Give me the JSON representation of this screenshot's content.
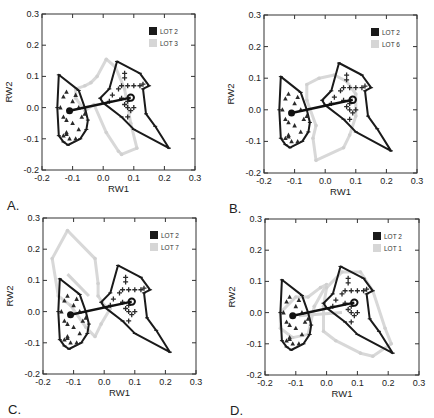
{
  "chart_data": [
    {
      "type": "scatter",
      "panel": "A.",
      "xlabel": "RW1",
      "ylabel": "RW2",
      "xlim": [
        -0.2,
        0.3
      ],
      "ylim": [
        -0.2,
        0.3
      ],
      "xticks": [
        "-0.2",
        "-0.1",
        "0.0",
        "0.1",
        "0.2",
        "0.3"
      ],
      "yticks": [
        "0.3",
        "0.2",
        "0.1",
        "0.0",
        "-0.1",
        "-0.2"
      ],
      "legend": [
        {
          "label": "LOT 2",
          "color": "#1a1a1a"
        },
        {
          "label": "LOT 3",
          "color": "#d6d6d6"
        }
      ],
      "comparison": "LOT 3",
      "gray_hulls": [
        [
          [
            -0.09,
            0.06
          ],
          [
            -0.06,
            0.07
          ],
          [
            -0.04,
            0.08
          ],
          [
            -0.02,
            0.1
          ],
          [
            0.01,
            0.155
          ],
          [
            0.04,
            0.13
          ],
          [
            0.07,
            0.06
          ],
          [
            0.09,
            -0.05
          ],
          [
            0.11,
            -0.13
          ],
          [
            0.06,
            -0.15
          ],
          [
            0.05,
            -0.14
          ],
          [
            0.01,
            -0.08
          ],
          [
            -0.03,
            0.01
          ],
          [
            -0.06,
            -0.01
          ],
          [
            -0.09,
            0.03
          ]
        ]
      ],
      "gray_link": [
        [
          -0.06,
          0.0
        ],
        [
          0.03,
          0.02
        ]
      ]
    },
    {
      "type": "scatter",
      "panel": "B.",
      "xlabel": "RW1",
      "ylabel": "RW2",
      "xlim": [
        -0.2,
        0.3
      ],
      "ylim": [
        -0.2,
        0.3
      ],
      "xticks": [
        "-0.2",
        "-0.1",
        "0.0",
        "0.1",
        "0.2",
        "0.3"
      ],
      "yticks": [
        "0.3",
        "0.2",
        "0.1",
        "0.0",
        "-0.1",
        "-0.2"
      ],
      "legend": [
        {
          "label": "LOT 2",
          "color": "#1a1a1a"
        },
        {
          "label": "LOT 6",
          "color": "#d6d6d6"
        }
      ],
      "comparison": "LOT 6",
      "gray_hulls": [
        [
          [
            -0.06,
            0.08
          ],
          [
            -0.02,
            0.1
          ],
          [
            0.03,
            0.11
          ],
          [
            0.07,
            0.09
          ],
          [
            0.1,
            0.05
          ],
          [
            0.1,
            -0.02
          ],
          [
            0.08,
            -0.08
          ],
          [
            0.06,
            -0.12
          ],
          [
            -0.03,
            -0.16
          ],
          [
            -0.04,
            -0.09
          ],
          [
            -0.03,
            -0.05
          ],
          [
            -0.06,
            0.03
          ]
        ]
      ],
      "gray_link": []
    },
    {
      "type": "scatter",
      "panel": "C.",
      "xlabel": "RW1",
      "ylabel": "RW2",
      "xlim": [
        -0.2,
        0.3
      ],
      "ylim": [
        -0.2,
        0.3
      ],
      "xticks": [
        "-0.2",
        "-0.1",
        "0.0",
        "0.1",
        "0.2",
        "0.3"
      ],
      "yticks": [
        "0.3",
        "0.2",
        "0.1",
        "0.0",
        "-0.1",
        "-0.2"
      ],
      "legend": [
        {
          "label": "LOT 2",
          "color": "#1a1a1a"
        },
        {
          "label": "LOT 7",
          "color": "#d6d6d6"
        }
      ],
      "comparison": "LOT 7",
      "gray_hulls": [
        [
          [
            -0.17,
            0.17
          ],
          [
            -0.12,
            0.26
          ],
          [
            -0.03,
            0.17
          ],
          [
            -0.02,
            0.09
          ],
          [
            -0.02,
            0.05
          ],
          [
            0.0,
            0.02
          ],
          [
            0.02,
            0.01
          ],
          [
            -0.01,
            -0.04
          ],
          [
            -0.03,
            -0.08
          ],
          [
            -0.06,
            -0.05
          ],
          [
            -0.11,
            0.02
          ],
          [
            -0.15,
            0.05
          ]
        ]
      ],
      "gray_link": [
        [
          -0.12,
          0.12
        ],
        [
          -0.05,
          0.05
        ]
      ]
    },
    {
      "type": "scatter",
      "panel": "D.",
      "xlabel": "RW1",
      "ylabel": "RW2",
      "xlim": [
        -0.2,
        0.3
      ],
      "ylim": [
        -0.2,
        0.3
      ],
      "xticks": [
        "-0.2",
        "-0.1",
        "0.0",
        "0.1",
        "0.2",
        "0.3"
      ],
      "yticks": [
        "0.3",
        "0.2",
        "0.1",
        "0.0",
        "-0.1",
        "-0.2"
      ],
      "legend": [
        {
          "label": "LOT 2",
          "color": "#1a1a1a"
        },
        {
          "label": "LOT 1",
          "color": "#d6d6d6"
        }
      ],
      "comparison": "LOT 1",
      "gray_hulls": [
        [
          [
            -0.15,
            0.0
          ],
          [
            -0.1,
            0.05
          ],
          [
            -0.06,
            0.05
          ],
          [
            -0.02,
            0.08
          ],
          [
            0.0,
            0.09
          ],
          [
            -0.04,
            0.02
          ],
          [
            -0.06,
            -0.07
          ],
          [
            -0.11,
            -0.08
          ],
          [
            -0.15,
            -0.05
          ]
        ],
        [
          [
            0.0,
            0.08
          ],
          [
            0.05,
            0.13
          ],
          [
            0.11,
            0.13
          ],
          [
            0.15,
            0.07
          ],
          [
            0.19,
            -0.05
          ],
          [
            0.21,
            -0.1
          ],
          [
            0.15,
            -0.14
          ],
          [
            0.11,
            -0.13
          ],
          [
            0.03,
            -0.09
          ],
          [
            -0.01,
            -0.06
          ],
          [
            -0.01,
            0.02
          ]
        ]
      ],
      "gray_link": [
        [
          -0.09,
          -0.01
        ],
        [
          0.05,
          0.0
        ]
      ]
    }
  ],
  "lot2": {
    "left_hull": [
      [
        -0.145,
        0.105
      ],
      [
        -0.08,
        0.055
      ],
      [
        -0.06,
        0.0
      ],
      [
        -0.05,
        -0.04
      ],
      [
        -0.055,
        -0.07
      ],
      [
        -0.075,
        -0.1
      ],
      [
        -0.115,
        -0.12
      ],
      [
        -0.13,
        -0.11
      ],
      [
        -0.145,
        -0.09
      ],
      [
        -0.15,
        0.0
      ]
    ],
    "right_hull": [
      [
        0.045,
        0.148
      ],
      [
        0.12,
        0.11
      ],
      [
        0.15,
        0.07
      ],
      [
        0.13,
        0.06
      ],
      [
        0.14,
        -0.02
      ],
      [
        0.17,
        -0.06
      ],
      [
        0.215,
        -0.13
      ],
      [
        0.1,
        -0.07
      ],
      [
        0.06,
        -0.03
      ],
      [
        0.0,
        0.015
      ],
      [
        -0.01,
        0.03
      ],
      [
        0.02,
        0.06
      ]
    ],
    "left_mean": [
      -0.11,
      -0.01
    ],
    "right_mean": [
      0.09,
      0.032
    ],
    "triangles": [
      [
        -0.12,
        0.05
      ],
      [
        -0.13,
        0.035
      ],
      [
        -0.1,
        0.02
      ],
      [
        -0.09,
        0.04
      ],
      [
        -0.12,
        -0.04
      ],
      [
        -0.13,
        -0.03
      ],
      [
        -0.1,
        -0.05
      ],
      [
        -0.08,
        -0.07
      ],
      [
        -0.07,
        -0.03
      ],
      [
        -0.06,
        -0.02
      ],
      [
        -0.12,
        -0.085
      ],
      [
        -0.13,
        -0.09
      ],
      [
        -0.11,
        -0.1
      ],
      [
        -0.12,
        -0.08
      ],
      [
        -0.09,
        -0.1
      ],
      [
        -0.14,
        0.0
      ],
      [
        -0.08,
        0.0
      ]
    ],
    "crosses": [
      [
        0.07,
        0.11
      ],
      [
        0.07,
        0.095
      ],
      [
        0.08,
        0.07
      ],
      [
        0.06,
        0.07
      ],
      [
        0.1,
        0.07
      ],
      [
        0.12,
        0.07
      ],
      [
        0.13,
        0.075
      ],
      [
        0.06,
        0.03
      ],
      [
        0.08,
        0.02
      ],
      [
        0.07,
        0.01
      ],
      [
        0.08,
        0.0
      ],
      [
        0.09,
        -0.01
      ],
      [
        0.1,
        0.0
      ],
      [
        0.08,
        -0.03
      ],
      [
        0.03,
        0.04
      ],
      [
        0.05,
        0.06
      ],
      [
        0.02,
        0.02
      ]
    ]
  },
  "labels": {
    "xlabel": "RW1",
    "ylabel": "RW2"
  }
}
